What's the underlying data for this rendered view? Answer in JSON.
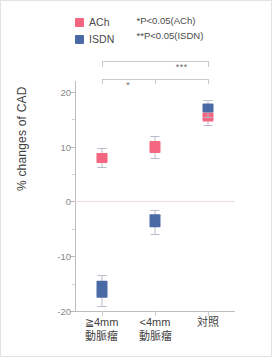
{
  "legend": {
    "items": [
      {
        "label": "ACh",
        "color": "#f4667f",
        "icon": "legend-swatch-ach"
      },
      {
        "label": "ISDN",
        "color": "#4a6aa5",
        "icon": "legend-swatch-isdn"
      }
    ],
    "notes": [
      "*P<0.05(ACh)",
      "**P<0.05(ISDN)"
    ]
  },
  "chart_data": {
    "type": "scatter",
    "title": "",
    "xlabel": "",
    "ylabel": "% changes of CAD",
    "ylim": [
      -20,
      22
    ],
    "yticks": [
      20,
      10,
      0,
      -10,
      -20
    ],
    "yticks_minor": [
      15,
      5,
      -5,
      -15
    ],
    "grid": false,
    "legend_position": "top-left",
    "categories": [
      "≧4mm\n動脈瘤",
      "<4mm\n動脈瘤",
      "対照"
    ],
    "categories_lines": [
      [
        "≧4mm",
        "動脈瘤"
      ],
      [
        "<4mm",
        "動脈瘤"
      ],
      [
        "対照",
        ""
      ]
    ],
    "series": [
      {
        "name": "ACh",
        "color": "#f4667f",
        "values": [
          8.0,
          10.0,
          15.5
        ],
        "err_low": [
          6.3,
          8.0,
          14.0
        ],
        "err_high": [
          9.7,
          12.0,
          17.0
        ]
      },
      {
        "name": "ISDN",
        "color": "#4a6aa5",
        "values": [
          -16.0,
          -3.5,
          17.0
        ],
        "err_low": [
          -19.0,
          -6.0,
          15.5
        ],
        "err_high": [
          -13.5,
          -1.5,
          18.5
        ]
      }
    ],
    "annotations": [
      {
        "name": "bracket-upper",
        "marks": "***",
        "from": "≧4mm 動脈瘤",
        "to": "対照"
      },
      {
        "name": "bracket-lower-left",
        "marks": "*",
        "from": "≧4mm 動脈瘤",
        "to": "<4mm 動脈瘤"
      },
      {
        "name": "bracket-lower-right",
        "marks": "",
        "from": "<4mm 動脈瘤",
        "to": "対照"
      }
    ],
    "significance_marks": {
      "left": "*",
      "right": "***"
    }
  }
}
